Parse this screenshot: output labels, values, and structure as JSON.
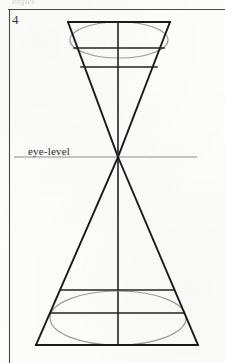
{
  "document": {
    "page_number": "4",
    "faint_header_text": "angles",
    "background_color": "#fdfdfc",
    "ink_color": "#1b1b1b",
    "construction_line_color": "#9c9c9c"
  },
  "labels": {
    "eye_level": "eye-level"
  },
  "frame": {
    "top_rule": {
      "x1": 8,
      "y1": 9,
      "x2": 225,
      "y2": 10
    },
    "left_rule": {
      "x1": 9,
      "y1": 9,
      "x2": 10,
      "y2": 363
    }
  },
  "diagram": {
    "type": "two-point-perspective-double-cone",
    "vanishing_point": {
      "x": 118,
      "y": 157
    },
    "horizon_line": {
      "x1": 14,
      "y1": 157,
      "x2": 197,
      "y2": 157
    },
    "vertical_axis": {
      "x": 118,
      "y1": 22,
      "y2": 345
    },
    "upper_form": {
      "shape": "inverted-trapezoid",
      "top_edge": {
        "x1": 68,
        "y": 22,
        "x2": 170
      },
      "left_side": {
        "x1": 68,
        "y1": 22,
        "x2": 118,
        "y2": 157
      },
      "right_side": {
        "x1": 170,
        "y1": 22,
        "x2": 118,
        "y2": 157
      },
      "cross_lines": [
        {
          "x1": 74,
          "y": 48,
          "x2": 164
        },
        {
          "x1": 81,
          "y": 67,
          "x2": 157
        }
      ],
      "ellipse": {
        "cx": 119,
        "cy": 40,
        "rx": 49,
        "ry": 18
      }
    },
    "lower_form": {
      "shape": "trapezoid",
      "bottom_edge": {
        "x1": 36,
        "y": 345,
        "x2": 198
      },
      "left_side": {
        "x1": 118,
        "y1": 157,
        "x2": 36,
        "y2": 345
      },
      "right_side": {
        "x1": 118,
        "y1": 157,
        "x2": 198,
        "y2": 345
      },
      "cross_lines": [
        {
          "x1": 61,
          "y": 290,
          "x2": 174
        },
        {
          "x1": 51,
          "y": 313,
          "x2": 184
        }
      ],
      "ellipse": {
        "cx": 118,
        "cy": 318,
        "rx": 68,
        "ry": 27
      }
    }
  }
}
